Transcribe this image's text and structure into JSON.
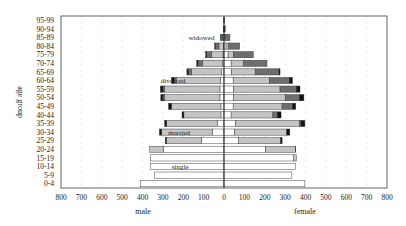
{
  "chart_data": {
    "type": "bar",
    "subtype": "population-pyramid-stacked",
    "title": "",
    "ylabel": "age group",
    "xlabel_left": "male",
    "xlabel_right": "female",
    "x_ticks": [
      "800",
      "700",
      "600",
      "500",
      "400",
      "300",
      "200",
      "100",
      "0",
      "100",
      "200",
      "300",
      "400",
      "500",
      "600",
      "700",
      "800"
    ],
    "xlim": [
      -800,
      800
    ],
    "grid": "vertical dotted",
    "categories": [
      "0-4",
      "5-9",
      "10-14",
      "15-19",
      "20-24",
      "25-29",
      "30-34",
      "35-39",
      "40-44",
      "45-49",
      "50-54",
      "55-59",
      "60-64",
      "65-69",
      "70-74",
      "75-79",
      "80-84",
      "85-89",
      "90-94",
      "95-99"
    ],
    "segment_order": [
      "single",
      "married",
      "widowed",
      "divorced"
    ],
    "colors": {
      "single": "#ffffff",
      "married": "#c4c4c4",
      "widowed": "#6e6e6e",
      "divorced": "#111111",
      "grid": "#bbbbbb",
      "frame": "#555555"
    },
    "annotations": [
      {
        "text": "widowed",
        "x": -110,
        "row": "85-89"
      },
      {
        "text": "divorced",
        "x": -250,
        "row": "60-64"
      },
      {
        "text": "married",
        "x": -220,
        "row": "30-34"
      },
      {
        "text": "single",
        "x": -215,
        "row": "10-14"
      }
    ],
    "series": [
      {
        "name": "male single",
        "side": "male",
        "values": [
          411,
          342,
          360,
          360,
          298,
          110,
          58,
          32,
          15,
          15,
          20,
          20,
          18,
          12,
          8,
          5,
          3,
          1,
          0,
          0
        ]
      },
      {
        "name": "male married",
        "side": "male",
        "values": [
          0,
          0,
          0,
          0,
          67,
          172,
          249,
          250,
          182,
          243,
          272,
          272,
          217,
          148,
          97,
          55,
          22,
          5,
          0,
          0
        ]
      },
      {
        "name": "male widowed",
        "side": "male",
        "values": [
          0,
          0,
          0,
          0,
          0,
          0,
          0,
          0,
          0,
          0,
          8,
          8,
          10,
          15,
          23,
          25,
          18,
          9,
          4,
          1
        ]
      },
      {
        "name": "male divorced",
        "side": "male",
        "values": [
          0,
          0,
          0,
          0,
          0,
          6,
          10,
          9,
          9,
          14,
          10,
          12,
          13,
          7,
          6,
          5,
          3,
          1,
          0,
          0
        ]
      },
      {
        "name": "female single",
        "side": "female",
        "values": [
          397,
          333,
          352,
          340,
          205,
          70,
          53,
          58,
          35,
          45,
          48,
          48,
          45,
          38,
          35,
          20,
          10,
          3,
          1,
          0
        ]
      },
      {
        "name": "female married",
        "side": "female",
        "values": [
          0,
          0,
          0,
          15,
          145,
          208,
          255,
          312,
          205,
          240,
          254,
          227,
          177,
          115,
          61,
          26,
          12,
          4,
          1,
          0
        ]
      },
      {
        "name": "female widowed",
        "side": "female",
        "values": [
          0,
          0,
          0,
          0,
          0,
          0,
          0,
          8,
          22,
          51,
          68,
          80,
          98,
          117,
          115,
          98,
          55,
          22,
          4,
          2
        ]
      },
      {
        "name": "female divorced",
        "side": "female",
        "values": [
          0,
          0,
          0,
          0,
          2,
          7,
          15,
          19,
          18,
          16,
          22,
          18,
          16,
          5,
          0,
          0,
          0,
          0,
          0,
          0
        ]
      }
    ]
  }
}
